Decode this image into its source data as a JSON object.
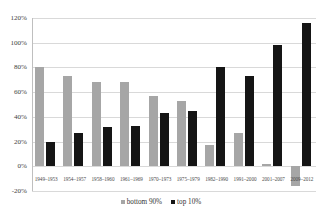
{
  "chart_data": {
    "type": "bar",
    "title": "",
    "subtitle": "",
    "xlabel": "",
    "ylabel": "",
    "grid": true,
    "legend_position": "bottom",
    "ylim": [
      -20,
      120
    ],
    "ytick_labels": [
      "120%",
      "100%",
      "80%",
      "60%",
      "40%",
      "20%",
      "0%",
      "-20%"
    ],
    "ytick_values": [
      120,
      100,
      80,
      60,
      40,
      20,
      0,
      -20
    ],
    "categories": [
      "1949–1953",
      "1954–1957",
      "1958–1960",
      "1961–1969",
      "1970–1973",
      "1975–1979",
      "1982–1990",
      "1991–2000",
      "2001–2007",
      "2009–2012"
    ],
    "series": [
      {
        "name": "bottom 90%",
        "color": "#a6a6a6",
        "values": [
          80,
          73,
          68,
          68,
          57,
          53,
          17,
          27,
          2,
          -16
        ]
      },
      {
        "name": "top 10%",
        "color": "#151515",
        "values": [
          20,
          27,
          32,
          33,
          43,
          45,
          80,
          73,
          98,
          116
        ]
      }
    ]
  },
  "legend": {
    "items": [
      {
        "label": "bottom 90%",
        "color": "#a6a6a6"
      },
      {
        "label": "top 10%",
        "color": "#151515"
      }
    ]
  }
}
